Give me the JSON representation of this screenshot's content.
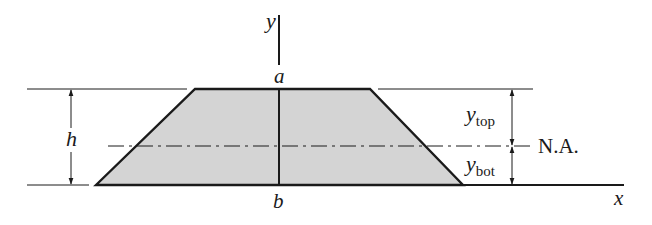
{
  "diagram": {
    "colors": {
      "fill": "#d4d4d4",
      "stroke": "#1a1a1a",
      "background": "#ffffff"
    },
    "geometry": {
      "top_y": 89,
      "bottom_y": 185,
      "na_y": 146,
      "trapezoid": [
        [
          96,
          185
        ],
        [
          195,
          89
        ],
        [
          370,
          89
        ],
        [
          463,
          185
        ]
      ],
      "y_axis_x": 279,
      "y_axis_top": 15,
      "x_axis_end": 624
    },
    "labels": {
      "y_axis": "y",
      "x_axis": "x",
      "top_point": "a",
      "bottom_point": "b",
      "height": "h",
      "y_top_main": "y",
      "y_top_sub": "top",
      "y_bot_main": "y",
      "y_bot_sub": "bot",
      "neutral_axis": "N.A."
    }
  }
}
